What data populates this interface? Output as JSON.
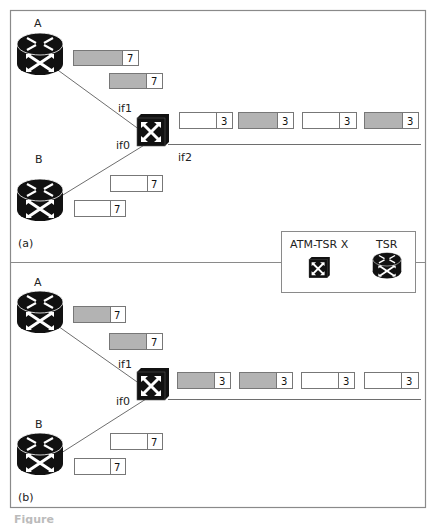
{
  "colors": {
    "frame": "#8a8a8a",
    "cell_gray": "#b3b3b3",
    "cell_white": "#ffffff",
    "device": "#111111",
    "line": "#6e6e6e"
  },
  "legend": {
    "atm_label": "ATM-TSR X",
    "tsr_label": "TSR"
  },
  "panels": [
    {
      "tag": "(a)",
      "router_a_label": "A",
      "router_b_label": "B",
      "switch_ports": {
        "if1": "if1",
        "if0": "if0",
        "if2": "if2"
      },
      "cells_from_a": [
        {
          "fill": "gray",
          "label": "7"
        },
        {
          "fill": "gray",
          "label": "7"
        }
      ],
      "cells_from_b": [
        {
          "fill": "white",
          "label": "7"
        },
        {
          "fill": "white",
          "label": "7"
        }
      ],
      "cells_out": [
        {
          "fill": "white",
          "label": "3"
        },
        {
          "fill": "gray",
          "label": "3"
        },
        {
          "fill": "white",
          "label": "3"
        },
        {
          "fill": "gray",
          "label": "3"
        }
      ]
    },
    {
      "tag": "(b)",
      "router_a_label": "A",
      "router_b_label": "B",
      "switch_ports": {
        "if1": "if1",
        "if0": "if0"
      },
      "cells_from_a": [
        {
          "fill": "gray",
          "label": "7"
        },
        {
          "fill": "gray",
          "label": "7"
        }
      ],
      "cells_from_b": [
        {
          "fill": "white",
          "label": "7"
        },
        {
          "fill": "white",
          "label": "7"
        }
      ],
      "cells_out": [
        {
          "fill": "gray",
          "label": "3"
        },
        {
          "fill": "gray",
          "label": "3"
        },
        {
          "fill": "white",
          "label": "3"
        },
        {
          "fill": "white",
          "label": "3"
        }
      ]
    }
  ],
  "caption": "Figure"
}
